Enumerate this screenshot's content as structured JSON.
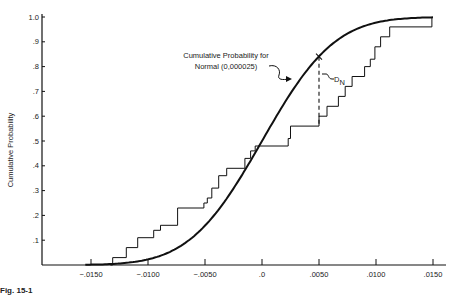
{
  "chart_data": {
    "type": "line",
    "title": "",
    "xlabel": "",
    "ylabel": "Cumulative Probability",
    "xlim": [
      -0.0175,
      0.0165
    ],
    "ylim": [
      0,
      1.0
    ],
    "grid": false,
    "x_ticks": [
      -0.015,
      -0.01,
      -0.005,
      0.0,
      0.005,
      0.01,
      0.015
    ],
    "x_tick_labels": [
      "−.0150",
      "−.0100",
      "−.0050",
      ".0",
      ".0050",
      ".0100",
      ".0150"
    ],
    "y_ticks": [
      0.1,
      0.2,
      0.3,
      0.4,
      0.5,
      0.6,
      0.7,
      0.8,
      0.9,
      1.0
    ],
    "y_tick_labels": [
      ".1",
      ".2",
      ".3",
      ".4",
      ".5",
      ".6",
      ".7",
      ".8",
      ".9",
      "1.0"
    ],
    "series": [
      {
        "name": "Cumulative Probability for Normal (0,000025)",
        "kind": "smooth-cdf",
        "mean": 0.0,
        "variance": 2.5e-05,
        "x_range": [
          -0.0155,
          0.015
        ]
      },
      {
        "name": "Empirical cumulative distribution (step function)",
        "kind": "step",
        "start_x": -0.0131,
        "end_x": 0.0149,
        "steps": [
          {
            "x": -0.0131,
            "p": 0.03
          },
          {
            "x": -0.0119,
            "p": 0.07
          },
          {
            "x": -0.0109,
            "p": 0.11
          },
          {
            "x": -0.0095,
            "p": 0.14
          },
          {
            "x": -0.0089,
            "p": 0.16
          },
          {
            "x": -0.0074,
            "p": 0.23
          },
          {
            "x": -0.0051,
            "p": 0.25
          },
          {
            "x": -0.0048,
            "p": 0.27
          },
          {
            "x": -0.0044,
            "p": 0.31
          },
          {
            "x": -0.0038,
            "p": 0.36
          },
          {
            "x": -0.0031,
            "p": 0.39
          },
          {
            "x": -0.0015,
            "p": 0.43
          },
          {
            "x": -0.001,
            "p": 0.46
          },
          {
            "x": -0.0006,
            "p": 0.48
          },
          {
            "x": 0.0023,
            "p": 0.51
          },
          {
            "x": 0.0025,
            "p": 0.56
          },
          {
            "x": 0.005,
            "p": 0.6
          },
          {
            "x": 0.0057,
            "p": 0.64
          },
          {
            "x": 0.0067,
            "p": 0.68
          },
          {
            "x": 0.0073,
            "p": 0.72
          },
          {
            "x": 0.0079,
            "p": 0.76
          },
          {
            "x": 0.009,
            "p": 0.8
          },
          {
            "x": 0.0095,
            "p": 0.83
          },
          {
            "x": 0.0099,
            "p": 0.88
          },
          {
            "x": 0.0104,
            "p": 0.92
          },
          {
            "x": 0.0112,
            "p": 0.96
          },
          {
            "x": 0.0149,
            "p": 1.0
          }
        ]
      }
    ],
    "annotations": [
      {
        "text": "Cumulative Probability for",
        "line": 1
      },
      {
        "text": "Normal (0,000025)",
        "line": 2
      },
      {
        "text": "D",
        "subscript": "N",
        "meaning": "max deviation at x=.0050 (dashed vertical line)",
        "x": 0.005,
        "p_top": 0.84,
        "p_bottom": 0.56
      }
    ],
    "legend": null
  },
  "labels": {
    "ylabel": "Cumulative Probability",
    "annot_line1": "Cumulative Probability for",
    "annot_line2": "Normal (0,000025)",
    "dn_main": "D",
    "dn_sub": "N",
    "caption_bold": "Fig. 15-1",
    "caption_rest": "Deviation of ... cumulative probability ..."
  }
}
